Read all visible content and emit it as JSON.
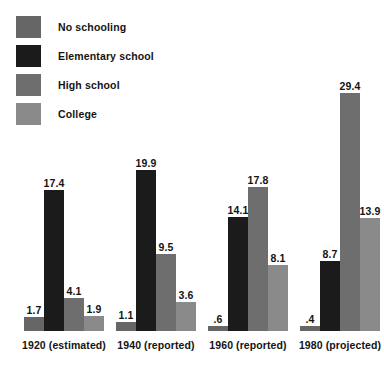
{
  "chart_data": {
    "type": "bar",
    "title": "",
    "subtitle": "",
    "xlabel": "",
    "ylabel": "",
    "grid": false,
    "legend_position": "top-left",
    "ylim": [
      0,
      29.4
    ],
    "categories": [
      "1920 (estimated)",
      "1940 (reported)",
      "1960 (reported)",
      "1980 (projected)"
    ],
    "series": [
      {
        "name": "No schooling",
        "color": "#666666",
        "values": [
          1.7,
          1.1,
          0.6,
          0.4
        ],
        "labels": [
          "1.7",
          "1.1",
          ".6",
          ".4"
        ]
      },
      {
        "name": "Elementary school",
        "color": "#1b1b1b",
        "values": [
          17.4,
          19.9,
          14.1,
          8.7
        ],
        "labels": [
          "17.4",
          "19.9",
          "14.1",
          "8.7"
        ]
      },
      {
        "name": "High school",
        "color": "#6e6e6e",
        "values": [
          4.1,
          9.5,
          17.8,
          29.4
        ],
        "labels": [
          "4.1",
          "9.5",
          "17.8",
          "29.4"
        ]
      },
      {
        "name": "College",
        "color": "#8a8a8a",
        "values": [
          1.9,
          3.6,
          8.1,
          13.9
        ],
        "labels": [
          "1.9",
          "3.6",
          "8.1",
          "13.9"
        ]
      }
    ]
  },
  "legend": {
    "items": [
      {
        "label": "No schooling",
        "color": "#666666"
      },
      {
        "label": "Elementary school",
        "color": "#1b1b1b"
      },
      {
        "label": "High school",
        "color": "#6e6e6e"
      },
      {
        "label": "College",
        "color": "#8a8a8a"
      }
    ]
  },
  "axis": {
    "ticks": [
      "1920 (estimated)",
      "1940 (reported)",
      "1960 (reported)",
      "1980 (projected)"
    ]
  }
}
